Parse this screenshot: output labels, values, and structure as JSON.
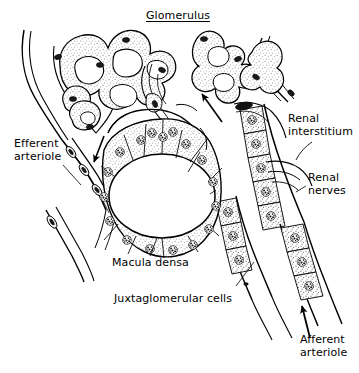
{
  "figure": {
    "width": 359,
    "height": 373,
    "background_color": "#ffffff",
    "ink_color": "#000000",
    "stipple_color": "#7a7a7a"
  },
  "labels": [
    {
      "id": "glomerulus",
      "name": "label-glomerulus",
      "text": "Glomerulus",
      "underlined": true,
      "x": 146,
      "y": 10,
      "align": "left"
    },
    {
      "id": "efferent-arteriole",
      "name": "label-efferent-arteriole",
      "text": "Efferent\narteriole",
      "underlined": false,
      "x": 14,
      "y": 138,
      "align": "left"
    },
    {
      "id": "renal-interstitium",
      "name": "label-renal-interstitium",
      "text": "Renal\ninterstitium",
      "underlined": false,
      "x": 288,
      "y": 113,
      "align": "left"
    },
    {
      "id": "renal-nerves",
      "name": "label-renal-nerves",
      "text": "Renal\nnerves",
      "underlined": false,
      "x": 308,
      "y": 172,
      "align": "left"
    },
    {
      "id": "macula-densa",
      "name": "label-macula-densa",
      "text": "Macula densa",
      "underlined": false,
      "x": 112,
      "y": 257,
      "align": "left"
    },
    {
      "id": "juxtaglomerular-cells",
      "name": "label-juxtaglomerular-cells",
      "text": "Juxtaglomerular cells",
      "underlined": false,
      "x": 114,
      "y": 293,
      "align": "left"
    },
    {
      "id": "afferent-arteriole",
      "name": "label-afferent-arteriole",
      "text": "Afferent\narteriole",
      "underlined": false,
      "x": 300,
      "y": 334,
      "align": "left"
    }
  ],
  "structures": {
    "glomerulus_note": "Convoluted glomerular capillary loops with stippled cytoplasm and dark oval endothelial nuclei, spanning the upper third of the figure",
    "macula_densa_note": "Central ring of tall columnar tubular epithelial cells, each with a dark granular nucleus, enclosing an oval lumen",
    "afferent_arteriole_note": "Right-hand vessel lined with cuboidal granular juxtaglomerular cells containing dark granular nuclei",
    "efferent_arteriole_note": "Left-hand narrow vessel with elongated dark nuclei along its wall",
    "arrow_count": 3,
    "arrow_meanings": [
      "Efferent blood flow away from glomerulus (downward, left)",
      "Afferent blood flow toward glomerulus (up-left, center right)",
      "Afferent blood flow toward glomerulus (upward, bottom right)"
    ]
  }
}
